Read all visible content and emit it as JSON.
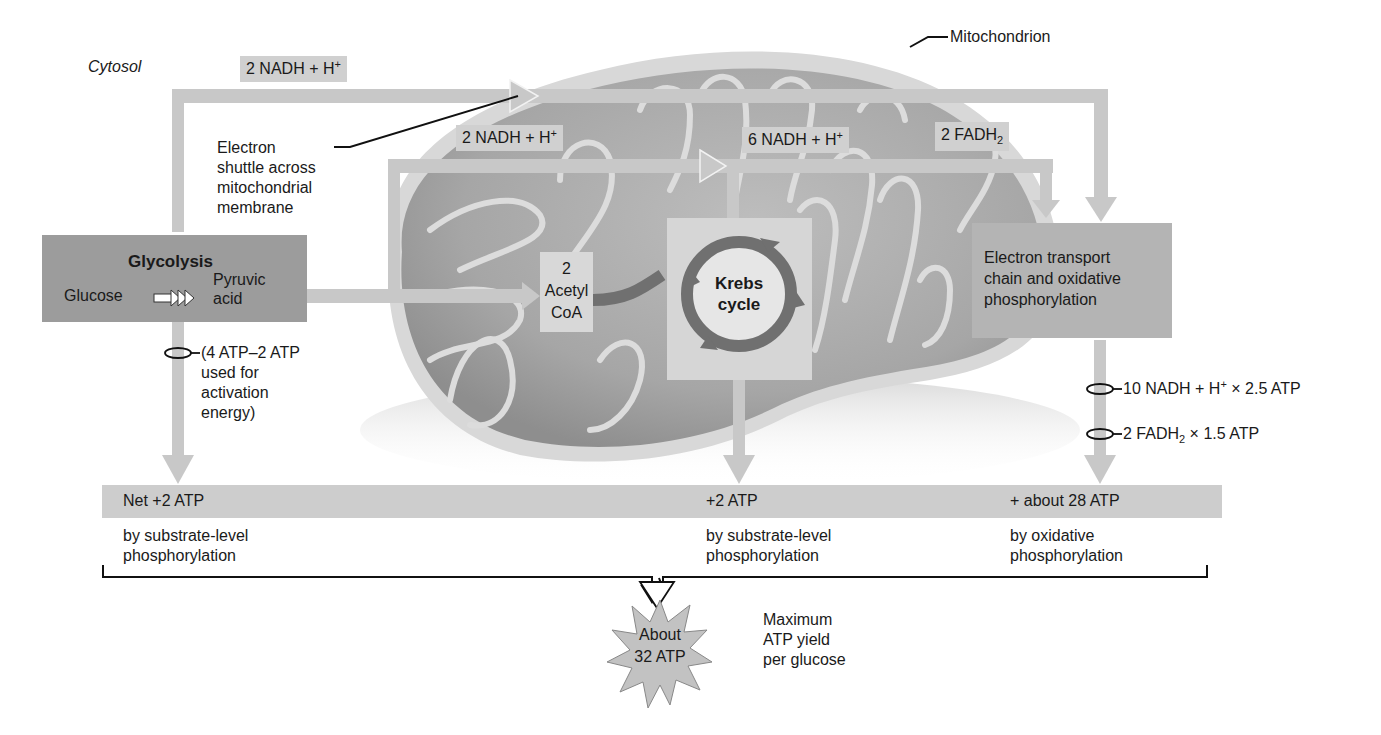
{
  "labels": {
    "cytosol": "Cytosol",
    "mitochondrion": "Mitochondrion",
    "electron_shuttle": [
      "Electron",
      "shuttle across",
      "mitochondrial",
      "membrane"
    ],
    "activation_note": [
      "(4 ATP–2 ATP",
      "used for",
      "activation",
      "energy)"
    ],
    "max_yield_note": [
      "Maximum",
      "ATP yield",
      "per glucose"
    ]
  },
  "carriers": {
    "cytosol_nadh": {
      "base": "2 NADH + H",
      "sup": "+"
    },
    "pyruvate_nadh": {
      "base": "2 NADH + H",
      "sup": "+"
    },
    "krebs_nadh": {
      "base": "6 NADH + H",
      "sup": "+"
    },
    "krebs_fadh2": {
      "base": "2 FADH",
      "sub": "2"
    }
  },
  "glycolysis": {
    "title": "Glycolysis",
    "input": "Glucose",
    "output": [
      "Pyruvic",
      "acid"
    ]
  },
  "acetyl_coa": [
    "2",
    "Acetyl",
    "CoA"
  ],
  "krebs": [
    "Krebs",
    "cycle"
  ],
  "etc": [
    "Electron transport",
    "chain and oxidative",
    "phosphorylation"
  ],
  "etc_yields": {
    "nadh": {
      "pre": "10 NADH + H",
      "sup": "+",
      "post": " × 2.5 ATP"
    },
    "fadh2": {
      "pre": "2 FADH",
      "sub": "2",
      "post": " × 1.5 ATP"
    }
  },
  "atp_bar": {
    "glycolysis": {
      "amount": "Net +2 ATP",
      "method": [
        "by substrate-level",
        "phosphorylation"
      ]
    },
    "krebs": {
      "amount": "+2 ATP",
      "method": [
        "by substrate-level",
        "phosphorylation"
      ]
    },
    "etc": {
      "amount": "+ about 28 ATP",
      "method": [
        "by oxidative",
        "phosphorylation"
      ]
    }
  },
  "total": [
    "About",
    "32 ATP"
  ],
  "colors": {
    "arrow": "#c8c8c8",
    "tag_bg": "#d0d0d0",
    "process_box": "#9c9c9c",
    "etc_box": "#b4b4b4",
    "krebs_ring": "#707070",
    "mito_outer": "#d6d6d6",
    "mito_inner": "#a8a8a8"
  }
}
